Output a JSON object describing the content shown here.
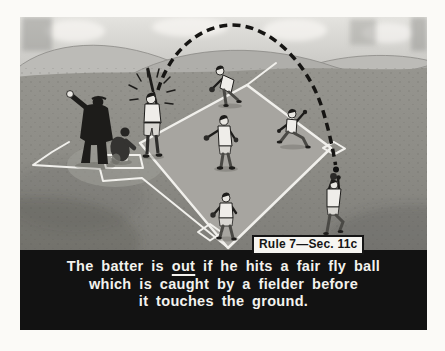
{
  "rule_badge": {
    "label": "Rule 7—Sec. 11c"
  },
  "caption": {
    "line1_pre": "The batter is ",
    "line1_underline": "out",
    "line1_post": " if he hits a fair fly ball",
    "line2": "which is caught by a fielder before",
    "line3": "it touches the ground."
  },
  "scene": {
    "figures": [
      "umpire",
      "catcher",
      "batter",
      "pitcher",
      "second-baseman",
      "runner",
      "infielder-at-base",
      "fielder-catching-fly-ball"
    ],
    "objects": [
      "baseball-diamond",
      "home-plate",
      "batters-box",
      "bases",
      "fly-ball-trajectory",
      "baseball",
      "hills",
      "sky-glow"
    ]
  },
  "colors": {
    "page_bg": "#fbfaf7",
    "caption_bg": "#121212",
    "caption_text": "#f3f2ee",
    "badge_bg": "#f6f5f1",
    "badge_border": "#151515",
    "badge_text": "#151515",
    "sky_top": "#e1e0dc",
    "sky_bottom": "#c8c7c3",
    "hill_light": "#bcbbb7",
    "hill_mid": "#afaeaa",
    "hill_line": "#8a8985",
    "field_top": "#95948e",
    "field_bottom": "#7e7d78",
    "infield": "#a7a5a0",
    "line_white": "#f1f0ec",
    "ink": "#1d1c1a",
    "uniform": "#efede9",
    "pants": "#d9d7d2",
    "skin": "#e8e6e1",
    "glove": "#2b2a28",
    "ball": "#111111",
    "trajectory": "#161513"
  }
}
